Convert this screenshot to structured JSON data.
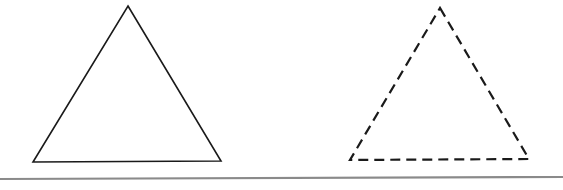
{
  "figure": {
    "title": "Two triangles above a horizontal rule",
    "canvas": {
      "width": 563,
      "height": 190
    },
    "background_color": "#ffffff",
    "ink_color": "#1a1a1a",
    "rule_color": "#8a8a8a",
    "shapes": [
      {
        "name": "solid-triangle",
        "label": "Left triangle (solid outline)",
        "kind": "triangle",
        "stroke_style": "solid",
        "stroke_color": "#1a1a1a",
        "stroke_width": 1.6,
        "fill": "none",
        "points": "128,6 221,161 33,162",
        "vertices": [
          {
            "name": "apex",
            "x": 128,
            "y": 6
          },
          {
            "name": "bottom-right",
            "x": 221,
            "y": 161
          },
          {
            "name": "bottom-left",
            "x": 33,
            "y": 162
          }
        ]
      },
      {
        "name": "dashed-triangle",
        "label": "Right triangle (dashed outline)",
        "kind": "triangle",
        "stroke_style": "dashed",
        "stroke_color": "#1a1a1a",
        "stroke_width": 2.2,
        "fill": "none",
        "dash_pattern": "10 6",
        "points": "440,8 529,159 350,160",
        "vertices": [
          {
            "name": "apex",
            "x": 440,
            "y": 8
          },
          {
            "name": "bottom-right",
            "x": 529,
            "y": 159
          },
          {
            "name": "bottom-left",
            "x": 350,
            "y": 160
          }
        ]
      }
    ],
    "baseline_rule": {
      "name": "baseline-rule",
      "label": "Horizontal separator rule",
      "stroke_color": "#8a8a8a",
      "stroke_width": 2.2,
      "x1": 0,
      "y1": 179,
      "x2": 563,
      "y2": 177
    }
  }
}
